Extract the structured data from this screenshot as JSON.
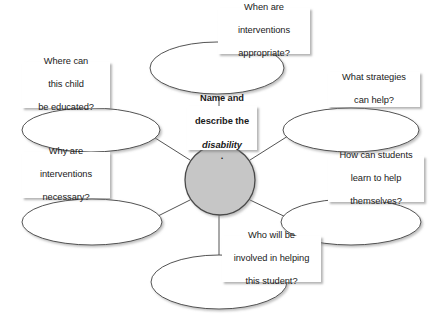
{
  "diagram": {
    "type": "concept-map",
    "background_color": "#ffffff",
    "center": {
      "label_line1": "Name and",
      "label_line2": "describe the",
      "label_line3_italic": "disability",
      "label_line3_tail": ".",
      "circle_fill": "#c6c6c6",
      "circle_stroke": "#4a4a4a"
    },
    "branches": [
      {
        "id": "when-interventions",
        "position": "top",
        "lines": [
          "When are",
          "interventions",
          "appropriate?"
        ]
      },
      {
        "id": "where-educated",
        "position": "upper-left",
        "lines": [
          "Where can",
          "this child",
          "be educated?"
        ]
      },
      {
        "id": "what-strategies",
        "position": "upper-right",
        "lines": [
          "What strategies",
          "can help?"
        ]
      },
      {
        "id": "why-interventions",
        "position": "lower-left",
        "lines": [
          "Why are",
          "interventions",
          "necessary?"
        ]
      },
      {
        "id": "how-students-help",
        "position": "lower-right",
        "lines": [
          "How can students",
          "learn to help",
          "themselves?"
        ]
      },
      {
        "id": "who-involved",
        "position": "bottom",
        "lines": [
          "Who will be",
          "involved in helping",
          "this student?"
        ]
      }
    ]
  }
}
